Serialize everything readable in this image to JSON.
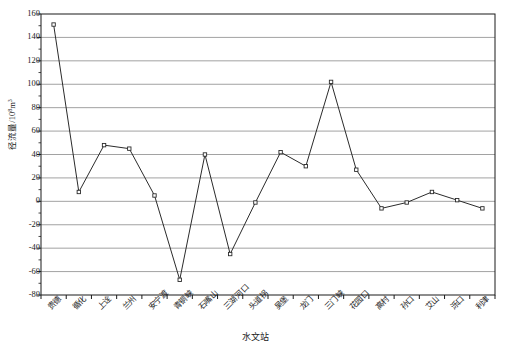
{
  "chart_data": {
    "type": "line",
    "title": "",
    "xlabel": "水文站",
    "ylabel_text": "径流量/10",
    "ylabel_sup": "8",
    "ylabel_tail": "m",
    "ylabel_sup2": "3",
    "ylabel_full": "径流量/10⁸m³",
    "categories": [
      "贵德",
      "循化",
      "上诠",
      "兰州",
      "安宁渡",
      "青铜峡",
      "石嘴山",
      "三湖河口",
      "头道拐",
      "吴堡",
      "龙门",
      "三门峡",
      "花园口",
      "高村",
      "孙口",
      "艾山",
      "泺口",
      "利津"
    ],
    "values": [
      151,
      8,
      48,
      45,
      5,
      -67,
      40,
      -45,
      -1,
      42,
      30,
      102,
      27,
      -6,
      -1,
      8,
      1,
      -6
    ],
    "series": [
      {
        "name": "径流量",
        "values": [
          151,
          8,
          48,
          45,
          5,
          -67,
          40,
          -45,
          -1,
          42,
          30,
          102,
          27,
          -6,
          -1,
          8,
          1,
          -6
        ]
      }
    ],
    "yticks": [
      160,
      140,
      120,
      100,
      80,
      60,
      40,
      20,
      0,
      -20,
      -40,
      -60,
      -80
    ],
    "ytick_labels": [
      "160",
      "140",
      "120",
      "100",
      "80",
      "60",
      "40",
      "20",
      "0",
      "-20",
      "-40",
      "-60",
      "-80"
    ],
    "ylim": [
      -80,
      160
    ],
    "grid": true,
    "grid_axis": "y",
    "legend": "none",
    "marker": "open-square",
    "line_color": "#2b2b2b",
    "grid_color": "#8a8a8a",
    "axis_color": "#1a1a1a",
    "marker_fill": "#ffffff"
  }
}
